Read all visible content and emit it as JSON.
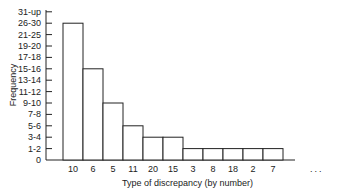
{
  "chart_data": {
    "type": "bar",
    "title": "",
    "xlabel": "Type of discrepancy (by number)",
    "ylabel": "Frequency",
    "y_tick_labels": [
      "0",
      "1-2",
      "3-4",
      "5-6",
      "7-8",
      "9-10",
      "11-12",
      "13-14",
      "15-16",
      "17-18",
      "19-20",
      "21-25",
      "26-30",
      "31-up"
    ],
    "categories": [
      "10",
      "6",
      "5",
      "11",
      "20",
      "15",
      "3",
      "8",
      "18",
      "2",
      "7"
    ],
    "values_band": [
      "26-30",
      "15-16",
      "9-10",
      "5-6",
      "3-4",
      "3-4",
      "1-2",
      "1-2",
      "1-2",
      "1-2",
      "1-2"
    ],
    "values_tick_index": [
      12,
      8,
      5,
      3,
      2,
      2,
      1,
      1,
      1,
      1,
      1
    ],
    "trailing_annotation": "...",
    "grid": false,
    "legend": null,
    "bar_fill": "#ffffff",
    "bar_stroke": "#222222"
  }
}
